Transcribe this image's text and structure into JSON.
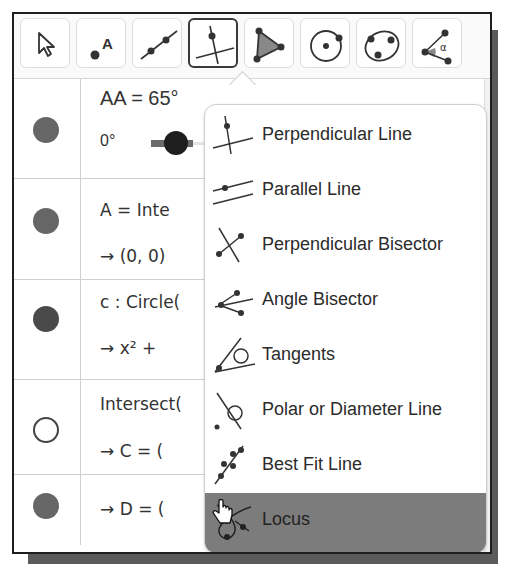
{
  "toolbar": {
    "tools": [
      {
        "name": "move",
        "icon": "cursor-arrow-icon",
        "active": false
      },
      {
        "name": "point",
        "icon": "point-icon",
        "label": "A",
        "active": false
      },
      {
        "name": "line",
        "icon": "line-through-two-points-icon",
        "active": false
      },
      {
        "name": "perpendicular-line",
        "icon": "perpendicular-line-icon",
        "active": true
      },
      {
        "name": "polygon",
        "icon": "polygon-icon",
        "active": false
      },
      {
        "name": "circle-center-point",
        "icon": "circle-center-point-icon",
        "active": false
      },
      {
        "name": "circle-three-points",
        "icon": "circle-three-points-icon",
        "active": false
      },
      {
        "name": "angle",
        "icon": "angle-icon",
        "label": "α",
        "active": false
      }
    ]
  },
  "algebra": {
    "rows": [
      {
        "marker": "filled",
        "line1": "AA = 65°",
        "slider_min": "0°",
        "slider_max": "360°"
      },
      {
        "marker": "filled",
        "line1": "A = Inte",
        "line1_hidden": "rsect(xAxis, yAxis)",
        "line2": "→  (0, 0)"
      },
      {
        "marker": "filled-dark",
        "line1": "c : Circle(",
        "line1_hidden": "A, 5.25)",
        "line2": "→  x² + ",
        "line2_hidden": "y² = 27.56"
      },
      {
        "marker": "hollow",
        "line1": "Intersect(",
        "line1_hidden": "c, xAxis)",
        "line2": "→  C = (",
        "line2_hidden": "5.25, 0)"
      },
      {
        "marker": "filled",
        "line2": "→  D = ("
      }
    ]
  },
  "menu": {
    "items": [
      {
        "label": "Perpendicular Line",
        "icon": "perpendicular-line-icon"
      },
      {
        "label": "Parallel Line",
        "icon": "parallel-line-icon"
      },
      {
        "label": "Perpendicular Bisector",
        "icon": "perpendicular-bisector-icon"
      },
      {
        "label": "Angle Bisector",
        "icon": "angle-bisector-icon"
      },
      {
        "label": "Tangents",
        "icon": "tangents-icon"
      },
      {
        "label": "Polar or Diameter Line",
        "icon": "polar-diameter-line-icon"
      },
      {
        "label": "Best Fit Line",
        "icon": "best-fit-line-icon"
      },
      {
        "label": "Locus",
        "icon": "locus-icon",
        "hovered": true
      }
    ]
  },
  "colors": {
    "hover_bg": "#7c7c7c",
    "active_border": "#3a3a3a",
    "point_fill": "#666666"
  }
}
